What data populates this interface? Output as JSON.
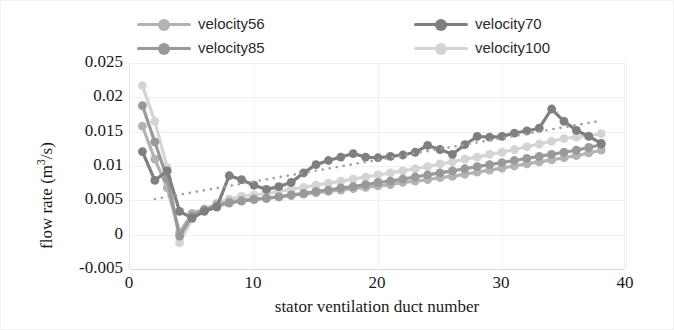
{
  "chart_data": {
    "type": "line",
    "title": "",
    "xlabel": "stator ventilation duct number",
    "ylabel_text": "flow rate (m",
    "ylabel_sup": "3",
    "ylabel_tail": "/s)",
    "ylabel": "flow rate (m3/s)",
    "xlim": [
      0,
      40
    ],
    "ylim": [
      -0.005,
      0.025
    ],
    "xticks": [
      0,
      10,
      20,
      30,
      40
    ],
    "xtick_labels": [
      "0",
      "10",
      "20",
      "30",
      "40"
    ],
    "yticks": [
      -0.005,
      0,
      0.005,
      0.01,
      0.015,
      0.02,
      0.025
    ],
    "ytick_labels": [
      "0.025",
      "0.02",
      "0.015",
      "0.01",
      "0.005",
      "0",
      "-0.005"
    ],
    "grid": true,
    "legend_position": "top",
    "x": [
      1,
      2,
      3,
      4,
      5,
      6,
      7,
      8,
      9,
      10,
      11,
      12,
      13,
      14,
      15,
      16,
      17,
      18,
      19,
      20,
      21,
      22,
      23,
      24,
      25,
      26,
      27,
      28,
      29,
      30,
      31,
      32,
      33,
      34,
      35,
      36,
      37,
      38
    ],
    "series": [
      {
        "name": "velocity56",
        "color": "#b3b3b3",
        "values": [
          0.0158,
          0.011,
          0.0068,
          0.0003,
          0.0031,
          0.0037,
          0.0044,
          0.0048,
          0.005,
          0.0052,
          0.0053,
          0.0055,
          0.0057,
          0.0059,
          0.0061,
          0.0063,
          0.0065,
          0.0067,
          0.0069,
          0.0071,
          0.0073,
          0.0076,
          0.0078,
          0.008,
          0.0083,
          0.0085,
          0.0088,
          0.0091,
          0.0094,
          0.0097,
          0.01,
          0.0103,
          0.0106,
          0.0109,
          0.0112,
          0.0115,
          0.0119,
          0.0123
        ]
      },
      {
        "name": "velocity70",
        "color": "#7f7f7f",
        "values": [
          0.0121,
          0.0079,
          0.0093,
          0.0034,
          0.0024,
          0.0034,
          0.004,
          0.0086,
          0.008,
          0.0072,
          0.0066,
          0.007,
          0.0076,
          0.009,
          0.0102,
          0.0108,
          0.0113,
          0.0118,
          0.0113,
          0.0112,
          0.0114,
          0.0116,
          0.012,
          0.013,
          0.0124,
          0.0117,
          0.0131,
          0.0143,
          0.0142,
          0.0143,
          0.0148,
          0.0151,
          0.0155,
          0.0183,
          0.0165,
          0.0152,
          0.0143,
          0.0133
        ]
      },
      {
        "name": "velocity85",
        "color": "#999999",
        "values": [
          0.0188,
          0.0135,
          0.0082,
          -0.0002,
          0.0027,
          0.0036,
          0.0042,
          0.0046,
          0.0049,
          0.0051,
          0.0053,
          0.0055,
          0.0058,
          0.006,
          0.0063,
          0.0065,
          0.0068,
          0.007,
          0.0073,
          0.0076,
          0.0078,
          0.0081,
          0.0084,
          0.0087,
          0.009,
          0.0093,
          0.0096,
          0.0099,
          0.0102,
          0.0105,
          0.0108,
          0.0111,
          0.0114,
          0.0117,
          0.012,
          0.0123,
          0.0127,
          0.0131
        ]
      },
      {
        "name": "velocity100",
        "color": "#d4d4d4",
        "values": [
          0.0217,
          0.0165,
          0.0098,
          -0.0012,
          0.0023,
          0.0035,
          0.0046,
          0.0052,
          0.0056,
          0.0058,
          0.006,
          0.0063,
          0.0066,
          0.0069,
          0.0072,
          0.0075,
          0.0078,
          0.0081,
          0.0084,
          0.0087,
          0.009,
          0.0093,
          0.0096,
          0.0099,
          0.0103,
          0.0106,
          0.011,
          0.0113,
          0.0117,
          0.012,
          0.0124,
          0.0128,
          0.0132,
          0.0136,
          0.014,
          0.0142,
          0.0144,
          0.0147
        ]
      }
    ],
    "trendline": {
      "name": "trendline",
      "color": "#a0a0a0",
      "style": "dotted",
      "x_start": 2,
      "x_end": 38,
      "y_start": 0.0052,
      "y_end": 0.0166
    }
  },
  "legend": {
    "items": [
      {
        "label": "velocity56",
        "color": "#b3b3b3"
      },
      {
        "label": "velocity85",
        "color": "#999999"
      },
      {
        "label": "velocity70",
        "color": "#7f7f7f"
      },
      {
        "label": "velocity100",
        "color": "#d4d4d4"
      }
    ]
  }
}
